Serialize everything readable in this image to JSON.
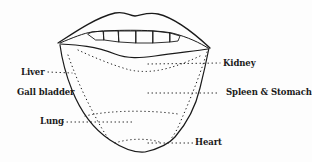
{
  "diagram": {
    "labels": {
      "kidney": "Kidney",
      "liver": "Liver",
      "gall_bladder": "Gall bladder",
      "spleen_stomach": "Spleen & Stomach",
      "lung": "Lung",
      "heart": "Heart"
    },
    "colors": {
      "ink": "#1a1a1a",
      "background": "#fdfdfd"
    }
  }
}
